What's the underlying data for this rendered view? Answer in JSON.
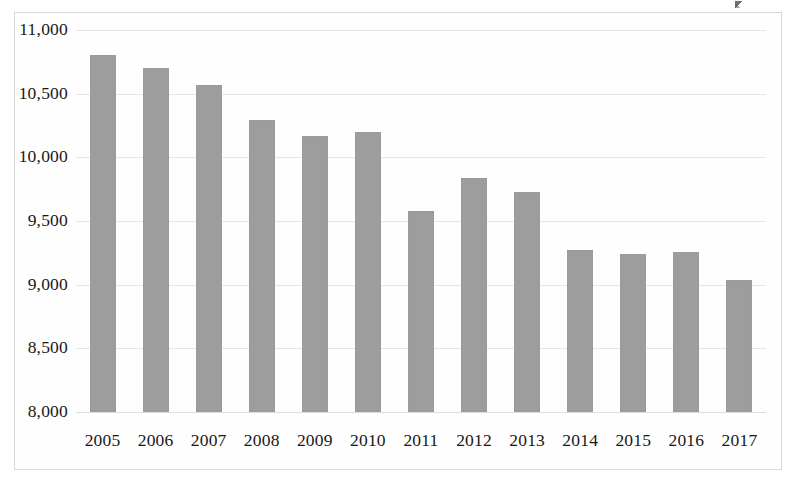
{
  "chart_data": {
    "type": "bar",
    "title": "",
    "subtitle": "",
    "xlabel": "",
    "ylabel": "",
    "categories": [
      "2005",
      "2006",
      "2007",
      "2008",
      "2009",
      "2010",
      "2011",
      "2012",
      "2013",
      "2014",
      "2015",
      "2016",
      "2017"
    ],
    "values": [
      10800,
      10700,
      10570,
      10290,
      10170,
      10200,
      9580,
      9840,
      9730,
      9270,
      9240,
      9260,
      9040
    ],
    "series": [
      {
        "name": "",
        "values": [
          10800,
          10700,
          10570,
          10290,
          10170,
          10200,
          9580,
          9840,
          9730,
          9270,
          9240,
          9260,
          9040
        ]
      }
    ],
    "ylim": [
      8000,
      11000
    ],
    "ytick_values": [
      11000,
      10500,
      10000,
      9500,
      9000,
      8500,
      8000
    ],
    "ytick_labels": [
      "11,000",
      "10,500",
      "10,000",
      "9,500",
      "9,000",
      "8,500",
      "8,000"
    ],
    "ytick_step": 500,
    "grid": true,
    "grid_axis": "y",
    "legend": false,
    "legend_position": "none",
    "bar_color": "#9d9d9d",
    "gridline_color": "#e6e6e6",
    "plot_background": "#fefefe",
    "border_color": "#d9d9d9",
    "annotations": []
  },
  "figure": {
    "frame_visible": true,
    "artifact": "scan-speck"
  }
}
